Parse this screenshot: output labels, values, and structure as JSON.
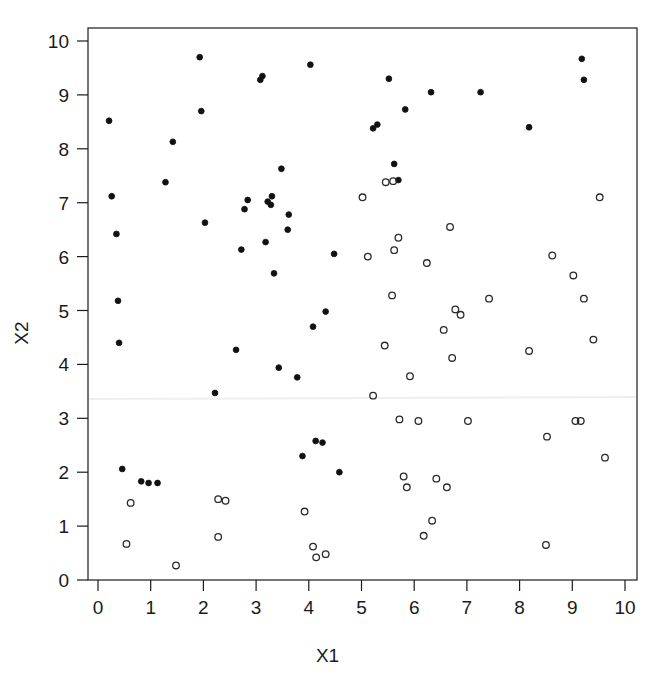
{
  "figure": {
    "cut_caption": "",
    "background": "#ffffff",
    "ink": "#1a1a1a",
    "artifact_line_color": "#efefef"
  },
  "chart_data": {
    "type": "scatter",
    "title": "",
    "xlabel": "X1",
    "ylabel": "X2",
    "xlim": [
      0,
      10
    ],
    "ylim": [
      0,
      10
    ],
    "xticks": [
      0,
      1,
      2,
      3,
      4,
      5,
      6,
      7,
      8,
      9,
      10
    ],
    "yticks": [
      0,
      1,
      2,
      3,
      4,
      5,
      6,
      7,
      8,
      9,
      10
    ],
    "xtick_labels": [
      "0",
      "1",
      "2",
      "3",
      "4",
      "5",
      "6",
      "7",
      "8",
      "9",
      "10"
    ],
    "ytick_labels": [
      "0",
      "1",
      "2",
      "3",
      "4",
      "5",
      "6",
      "7",
      "8",
      "9",
      "10"
    ],
    "grid": false,
    "legend": null,
    "legend_position": "none",
    "frame": "box",
    "series": [
      {
        "name": "class-1",
        "marker": "filled-circle",
        "color": "#111111",
        "fill": "#111111",
        "size": 7,
        "points": [
          [
            0.21,
            8.52
          ],
          [
            0.26,
            7.12
          ],
          [
            0.35,
            6.42
          ],
          [
            0.38,
            5.18
          ],
          [
            0.4,
            4.4
          ],
          [
            0.46,
            2.06
          ],
          [
            0.82,
            1.83
          ],
          [
            0.96,
            1.8
          ],
          [
            1.13,
            1.8
          ],
          [
            1.28,
            7.38
          ],
          [
            1.42,
            8.13
          ],
          [
            1.93,
            9.7
          ],
          [
            1.96,
            8.7
          ],
          [
            2.03,
            6.63
          ],
          [
            2.22,
            3.47
          ],
          [
            2.62,
            4.27
          ],
          [
            2.72,
            6.13
          ],
          [
            2.78,
            6.88
          ],
          [
            2.84,
            7.05
          ],
          [
            3.08,
            9.28
          ],
          [
            3.12,
            9.35
          ],
          [
            3.18,
            6.27
          ],
          [
            3.22,
            7.02
          ],
          [
            3.28,
            6.96
          ],
          [
            3.3,
            7.12
          ],
          [
            3.34,
            5.69
          ],
          [
            3.43,
            3.94
          ],
          [
            3.48,
            7.63
          ],
          [
            3.6,
            6.5
          ],
          [
            3.62,
            6.78
          ],
          [
            3.78,
            3.76
          ],
          [
            3.88,
            2.3
          ],
          [
            4.03,
            9.56
          ],
          [
            4.08,
            4.7
          ],
          [
            4.13,
            2.58
          ],
          [
            4.26,
            2.55
          ],
          [
            4.32,
            4.98
          ],
          [
            4.48,
            6.05
          ],
          [
            4.58,
            2.0
          ],
          [
            5.22,
            8.38
          ],
          [
            5.3,
            8.45
          ],
          [
            5.52,
            9.3
          ],
          [
            5.62,
            7.72
          ],
          [
            5.7,
            7.42
          ],
          [
            5.83,
            8.73
          ],
          [
            6.32,
            9.05
          ],
          [
            7.26,
            9.05
          ],
          [
            8.18,
            8.4
          ],
          [
            9.18,
            9.67
          ],
          [
            9.22,
            9.28
          ]
        ]
      },
      {
        "name": "class-2",
        "marker": "open-circle",
        "color": "#2a2a2a",
        "fill": "none",
        "size": 8,
        "points": [
          [
            0.62,
            1.43
          ],
          [
            0.54,
            0.67
          ],
          [
            1.48,
            0.27
          ],
          [
            2.28,
            1.5
          ],
          [
            2.42,
            1.47
          ],
          [
            2.28,
            0.8
          ],
          [
            3.92,
            1.27
          ],
          [
            4.08,
            0.62
          ],
          [
            4.14,
            0.42
          ],
          [
            4.32,
            0.48
          ],
          [
            5.02,
            7.1
          ],
          [
            5.12,
            6.0
          ],
          [
            5.22,
            3.42
          ],
          [
            5.44,
            4.35
          ],
          [
            5.46,
            7.38
          ],
          [
            5.6,
            7.4
          ],
          [
            5.62,
            6.12
          ],
          [
            5.58,
            5.28
          ],
          [
            5.7,
            6.35
          ],
          [
            5.72,
            2.98
          ],
          [
            5.8,
            1.92
          ],
          [
            5.86,
            1.72
          ],
          [
            5.92,
            3.78
          ],
          [
            6.08,
            2.95
          ],
          [
            6.18,
            0.82
          ],
          [
            6.24,
            5.88
          ],
          [
            6.42,
            1.88
          ],
          [
            6.34,
            1.1
          ],
          [
            6.56,
            4.64
          ],
          [
            6.62,
            1.72
          ],
          [
            6.68,
            6.55
          ],
          [
            6.72,
            4.12
          ],
          [
            6.78,
            5.02
          ],
          [
            6.88,
            4.92
          ],
          [
            7.02,
            2.95
          ],
          [
            7.42,
            5.22
          ],
          [
            8.18,
            4.25
          ],
          [
            8.5,
            0.65
          ],
          [
            8.52,
            2.66
          ],
          [
            8.62,
            6.02
          ],
          [
            9.02,
            5.65
          ],
          [
            9.06,
            2.95
          ],
          [
            9.16,
            2.95
          ],
          [
            9.22,
            5.22
          ],
          [
            9.4,
            4.46
          ],
          [
            9.52,
            7.1
          ],
          [
            9.62,
            2.27
          ]
        ]
      }
    ]
  }
}
